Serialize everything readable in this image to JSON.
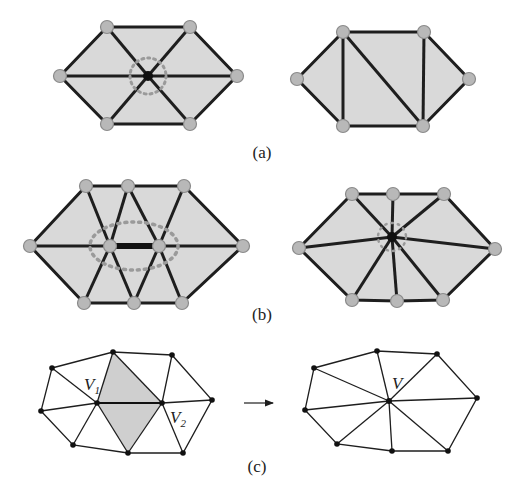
{
  "figure": {
    "captions": {
      "a": "(a)",
      "b": "(b)",
      "c": "(c)"
    },
    "labels": {
      "v1": "V",
      "v1_sub": "1",
      "v2": "V",
      "v2_sub": "2",
      "v": "V"
    },
    "colors": {
      "fill": "#d9d9d9",
      "edge": "#1e1e1e",
      "vertex_fill": "#b8b8b8",
      "vertex_stroke": "#8a8a8a",
      "dotted": "#9a9a9a",
      "shaded": "#cfcfcf"
    },
    "panels": {
      "a_left": {
        "description": "Hexagon with center vertex (to be removed), 6 spokes",
        "outer": [
          [
            60,
            76
          ],
          [
            107,
            27
          ],
          [
            190,
            27
          ],
          [
            237,
            76
          ],
          [
            190,
            124
          ],
          [
            107,
            124
          ]
        ],
        "center": [
          148,
          76
        ]
      },
      "a_right": {
        "description": "Re-triangulated hexagon after vertex removal",
        "outer": [
          [
            297,
            79
          ],
          [
            343,
            32
          ],
          [
            424,
            32
          ],
          [
            469,
            79
          ],
          [
            423,
            126
          ],
          [
            343,
            126
          ]
        ],
        "diagonals": [
          [
            [
              343,
              32
            ],
            [
              343,
              126
            ]
          ],
          [
            [
              343,
              32
            ],
            [
              423,
              126
            ]
          ],
          [
            [
              424,
              32
            ],
            [
              423,
              126
            ]
          ]
        ]
      },
      "b_left": {
        "description": "Edge between two inner vertices (to be collapsed)",
        "outer": [
          [
            30,
            246
          ],
          [
            86,
            186
          ],
          [
            128,
            186
          ],
          [
            184,
            186
          ],
          [
            243,
            246
          ],
          [
            182,
            303
          ],
          [
            134,
            303
          ],
          [
            84,
            303
          ]
        ],
        "inner": [
          [
            110,
            246
          ],
          [
            159,
            246
          ]
        ]
      },
      "b_right": {
        "description": "Edge collapsed into single vertex",
        "outer": [
          [
            299,
            248
          ],
          [
            352,
            194
          ],
          [
            393,
            194
          ],
          [
            444,
            194
          ],
          [
            495,
            249
          ],
          [
            443,
            300
          ],
          [
            397,
            301
          ],
          [
            352,
            300
          ]
        ],
        "center": [
          392,
          237
        ]
      },
      "c_left": {
        "description": "Edge collapse V1-V2 with shaded adjacent triangles",
        "outer": [
          [
            52,
            368
          ],
          [
            113,
            352
          ],
          [
            172,
            355
          ],
          [
            212,
            400
          ],
          [
            183,
            453
          ],
          [
            128,
            453
          ],
          [
            73,
            445
          ],
          [
            41,
            411
          ]
        ],
        "V1": [
          97,
          403
        ],
        "V2": [
          162,
          403
        ]
      },
      "c_right": {
        "description": "Result vertex V",
        "outer": [
          [
            314,
            368
          ],
          [
            377,
            351
          ],
          [
            437,
            354
          ],
          [
            477,
            398
          ],
          [
            448,
            451
          ],
          [
            392,
            451
          ],
          [
            337,
            444
          ],
          [
            305,
            410
          ]
        ],
        "V": [
          389,
          401
        ]
      }
    }
  }
}
